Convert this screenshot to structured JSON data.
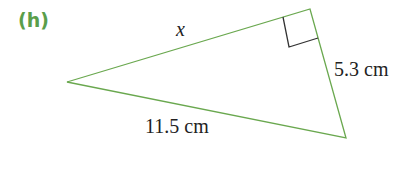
{
  "part_label": "(h)",
  "triangle": {
    "vertices": {
      "left": [
        67,
        82
      ],
      "top_right": [
        310,
        9
      ],
      "bottom_right": [
        346,
        138
      ]
    },
    "right_angle_at": "top_right",
    "sides": {
      "hypotenuse_unknown": "x",
      "short_leg": "5.3 cm",
      "long_side": "11.5 cm"
    },
    "stroke_color": "#6aa84f",
    "marker_color": "#333333"
  }
}
